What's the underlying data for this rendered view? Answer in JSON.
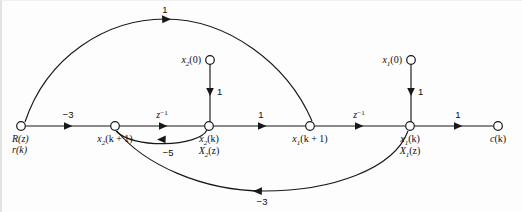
{
  "figure": {
    "type": "signal-flow-graph",
    "background_color": "#fdfdfd",
    "line_color": "#18181a"
  },
  "nodes": [
    {
      "id": "input",
      "name": "input-node",
      "label_lines": [
        "R(z)",
        "r(k)"
      ],
      "label_main": "R(z)",
      "label_secondary": "r(k)",
      "x": 19,
      "y": 125,
      "label_position": "below-left"
    },
    {
      "id": "x2kp1",
      "name": "x2-k-plus-1-node",
      "label_main": "x2(k + 1)",
      "base": "x",
      "subscript": "2",
      "argument": "(k + 1)",
      "x": 113,
      "y": 125,
      "label_position": "below"
    },
    {
      "id": "x2k",
      "name": "x2-k-node",
      "label_main": "x2(k)",
      "label_secondary": "X2(z)",
      "base": "x",
      "subscript": "2",
      "argument": "(k)",
      "x": 207,
      "y": 125,
      "label_position": "below"
    },
    {
      "id": "x1kp1",
      "name": "x1-k-plus-1-node",
      "label_main": "x1(k + 1)",
      "base": "x",
      "subscript": "1",
      "argument": "(k + 1)",
      "x": 308,
      "y": 125,
      "label_position": "below"
    },
    {
      "id": "x1k",
      "name": "x1-k-node",
      "label_main": "x1(k)",
      "label_secondary": "X1(z)",
      "base": "x",
      "subscript": "1",
      "argument": "(k)",
      "x": 408,
      "y": 125,
      "label_position": "below"
    },
    {
      "id": "output",
      "name": "output-node",
      "label_main": "c(k)",
      "base": "c",
      "argument": "(k)",
      "x": 496,
      "y": 125,
      "label_position": "below"
    },
    {
      "id": "x2init",
      "name": "x2-initial-condition-node",
      "label_main": "x2(0)",
      "base": "x",
      "subscript": "2",
      "argument": "(0)",
      "x": 208,
      "y": 59,
      "label_position": "left"
    },
    {
      "id": "x1init",
      "name": "x1-initial-condition-node",
      "label_main": "x1(0)",
      "base": "x",
      "subscript": "1",
      "argument": "(0)",
      "x": 409,
      "y": 59,
      "label_position": "left"
    }
  ],
  "edges": [
    {
      "id": "e-input-x2kp1",
      "name": "edge-input-to-x2kp1",
      "from": "input",
      "to": "x2kp1",
      "gain": "−3",
      "gain_type": "number",
      "shape": "straight",
      "direction": "right"
    },
    {
      "id": "e-x2kp1-x2k",
      "name": "edge-x2kp1-to-x2k-delay",
      "from": "x2kp1",
      "to": "x2k",
      "gain": "z",
      "gain_exponent": "−1",
      "gain_type": "operator",
      "shape": "straight",
      "direction": "right"
    },
    {
      "id": "e-x2k-x1kp1",
      "name": "edge-x2k-to-x1kp1",
      "from": "x2k",
      "to": "x1kp1",
      "gain": "1",
      "gain_type": "number",
      "shape": "straight",
      "direction": "right"
    },
    {
      "id": "e-x1kp1-x1k",
      "name": "edge-x1kp1-to-x1k-delay",
      "from": "x1kp1",
      "to": "x1k",
      "gain": "z",
      "gain_exponent": "−1",
      "gain_type": "operator",
      "shape": "straight",
      "direction": "right"
    },
    {
      "id": "e-x1k-output",
      "name": "edge-x1k-to-output",
      "from": "x1k",
      "to": "output",
      "gain": "1",
      "gain_type": "number",
      "shape": "straight",
      "direction": "right"
    },
    {
      "id": "e-x2init-x2k",
      "name": "edge-x2-initial-condition-to-x2k",
      "from": "x2init",
      "to": "x2k",
      "gain": "1",
      "gain_type": "number",
      "shape": "vertical",
      "direction": "down"
    },
    {
      "id": "e-x1init-x1k",
      "name": "edge-x1-initial-condition-to-x1k",
      "from": "x1init",
      "to": "x1k",
      "gain": "1",
      "gain_type": "number",
      "shape": "vertical",
      "direction": "down"
    },
    {
      "id": "e-input-x1kp1-arc",
      "name": "edge-input-to-x1kp1-upper-arc",
      "from": "input",
      "to": "x1kp1",
      "gain": "1",
      "gain_type": "number",
      "shape": "arc-above",
      "direction": "right"
    },
    {
      "id": "e-x2k-x2kp1-feedback",
      "name": "edge-x2k-to-x2kp1-feedback-arc",
      "from": "x2k",
      "to": "x2kp1",
      "gain": "−5",
      "gain_type": "number",
      "shape": "arc-below-small",
      "direction": "left"
    },
    {
      "id": "e-x1k-x2kp1-feedback",
      "name": "edge-x1k-to-x2kp1-feedback-arc",
      "from": "x1k",
      "to": "x2kp1",
      "gain": "−3",
      "gain_type": "number",
      "shape": "arc-below-large",
      "direction": "left"
    }
  ],
  "gain_labels": {
    "upper_arc": "1",
    "input_to_x2kp1": "−3",
    "delay_1": "z",
    "delay_1_exponent": "−1",
    "x2k_to_x1kp1": "1",
    "delay_2": "z",
    "delay_2_exponent": "−1",
    "x1k_to_output": "1",
    "x2_init_gain": "1",
    "x1_init_gain": "1",
    "feedback_small": "−5",
    "feedback_large": "−3"
  }
}
